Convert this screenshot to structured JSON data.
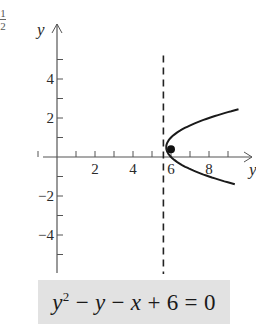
{
  "chart_data": {
    "type": "line",
    "title": "",
    "equation": "y^2 - y - x + 6 = 0",
    "equation_display": {
      "parts": [
        "y",
        "2",
        " − ",
        "y",
        " − ",
        "x",
        " + 6 = 0"
      ]
    },
    "xlabel": "y",
    "ylabel": "y",
    "x_ticks": [
      2,
      4,
      6,
      8
    ],
    "x_tick_labels": [
      "2",
      "4",
      "6",
      "8"
    ],
    "y_ticks": [
      4,
      2,
      -2,
      -4
    ],
    "y_tick_labels": [
      "4",
      "2",
      "−2",
      "−4"
    ],
    "xlim": [
      -1,
      10
    ],
    "ylim": [
      -6,
      6.5
    ],
    "grid": false,
    "series": [
      {
        "name": "parabola x = y^2 - y + 6",
        "style": "solid",
        "points": [
          {
            "x": 9.75,
            "y": 2.5
          },
          {
            "x": 8.0,
            "y": 2.0
          },
          {
            "x": 6.75,
            "y": 1.5
          },
          {
            "x": 6.0,
            "y": 1.0
          },
          {
            "x": 5.75,
            "y": 0.5
          },
          {
            "x": 6.0,
            "y": 0.0
          },
          {
            "x": 6.75,
            "y": -0.5
          },
          {
            "x": 8.0,
            "y": -1.0
          },
          {
            "x": 9.75,
            "y": -1.5
          }
        ]
      },
      {
        "name": "vertical dashed line",
        "style": "dashed",
        "x": 5.6,
        "y_range": [
          -6,
          5.2
        ]
      }
    ],
    "annotations": [
      {
        "type": "point",
        "x": 6.0,
        "y": 0.5,
        "label": ""
      }
    ],
    "corner_fragment": {
      "numerator": "1",
      "denominator": "2"
    }
  },
  "equation_text": "y² − y − x + 6 = 0"
}
